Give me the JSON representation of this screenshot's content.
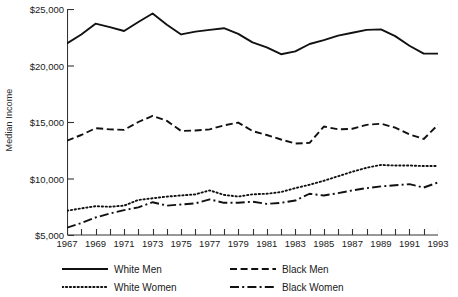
{
  "chart_data": {
    "type": "line",
    "title": "",
    "xlabel": "",
    "ylabel": "Median Income",
    "xlim": [
      1967,
      1993
    ],
    "ylim": [
      5000,
      25000
    ],
    "grid": false,
    "legend_position": "bottom",
    "x": [
      1967,
      1968,
      1969,
      1970,
      1971,
      1972,
      1973,
      1974,
      1975,
      1976,
      1977,
      1978,
      1979,
      1980,
      1981,
      1982,
      1983,
      1984,
      1985,
      1986,
      1987,
      1988,
      1989,
      1990,
      1991,
      1992,
      1993
    ],
    "ytick_labels": [
      "$25,000",
      "$20,000",
      "$15,000",
      "$10,000",
      "$5,000"
    ],
    "ytick_values": [
      25000,
      20000,
      15000,
      10000,
      5000
    ],
    "xtick_labels": [
      "1967",
      "1969",
      "1971",
      "1973",
      "1975",
      "1977",
      "1979",
      "1981",
      "1983",
      "1985",
      "1987",
      "1989",
      "1991",
      "1993"
    ],
    "xtick_values": [
      1967,
      1969,
      1971,
      1973,
      1975,
      1977,
      1979,
      1981,
      1983,
      1985,
      1987,
      1989,
      1991,
      1993
    ],
    "series": [
      {
        "name": "White Men",
        "style": "solid",
        "color": "#111111",
        "values": [
          21950,
          22750,
          23700,
          23400,
          23050,
          23850,
          24600,
          23600,
          22750,
          23000,
          23150,
          23300,
          22800,
          22050,
          21600,
          21000,
          21250,
          21900,
          22250,
          22650,
          22900,
          23150,
          23200,
          22600,
          21750,
          21050,
          21050
        ]
      },
      {
        "name": "Black Men",
        "style": "dashed",
        "color": "#111111",
        "values": [
          13350,
          13850,
          14450,
          14350,
          14300,
          15000,
          15550,
          15100,
          14200,
          14250,
          14350,
          14700,
          14950,
          14200,
          13850,
          13450,
          13100,
          13150,
          14600,
          14350,
          14400,
          14750,
          14850,
          14500,
          13900,
          13500,
          14750
        ]
      },
      {
        "name": "White Women",
        "style": "dotted",
        "color": "#111111",
        "values": [
          7150,
          7350,
          7550,
          7500,
          7600,
          8100,
          8250,
          8400,
          8500,
          8600,
          8950,
          8550,
          8400,
          8600,
          8650,
          8800,
          9150,
          9450,
          9800,
          10200,
          10600,
          10950,
          11200,
          11150,
          11150,
          11100,
          11100
        ]
      },
      {
        "name": "Black Women",
        "style": "dashdot",
        "color": "#111111",
        "values": [
          5650,
          6050,
          6550,
          6900,
          7200,
          7450,
          7900,
          7600,
          7700,
          7800,
          8150,
          7850,
          7850,
          7950,
          7750,
          7850,
          8050,
          8650,
          8500,
          8700,
          8950,
          9150,
          9300,
          9400,
          9500,
          9200,
          9650
        ]
      }
    ]
  },
  "legend": {
    "items": [
      {
        "label": "White Men",
        "style": "solid"
      },
      {
        "label": "Black Men",
        "style": "dashed"
      },
      {
        "label": "White Women",
        "style": "dotted"
      },
      {
        "label": "Black Women",
        "style": "dashdot"
      }
    ]
  }
}
